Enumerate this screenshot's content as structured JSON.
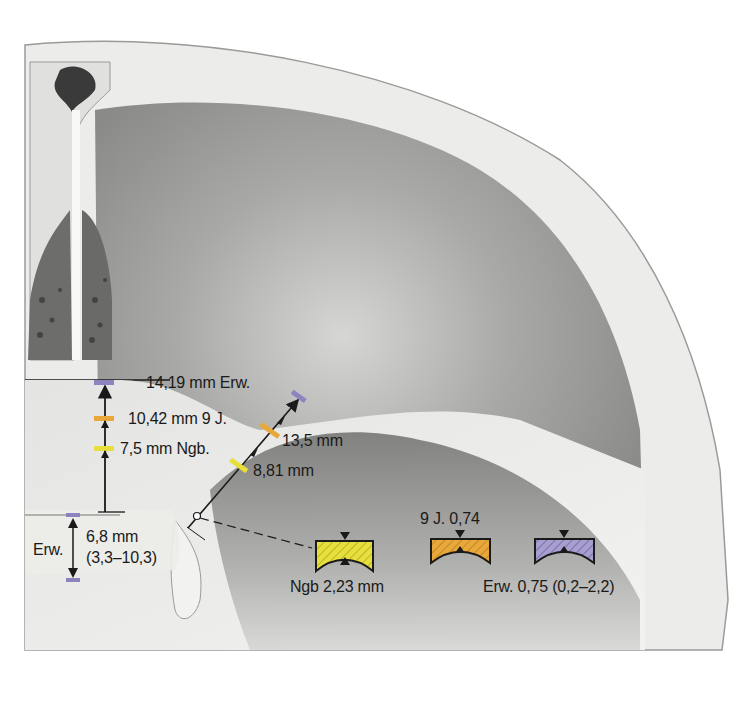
{
  "figure": {
    "colors": {
      "newborn": "#e6df3c",
      "nine_years": "#e8a93a",
      "adult": "#8e82bf",
      "bone_light": "#eeeeec",
      "bone_shade": "#8c8c8c",
      "line": "#1a1a1a"
    }
  },
  "vertical_measurement": {
    "labels": [
      {
        "id": "adult",
        "text": "14,19 mm Erw."
      },
      {
        "id": "nine_years",
        "text": "10,42 mm 9 J."
      },
      {
        "id": "newborn",
        "text": "7,5 mm Ngb."
      }
    ]
  },
  "oblique_measurement": {
    "labels": [
      {
        "id": "adult_9y",
        "text": "13,5 mm"
      },
      {
        "id": "newborn",
        "text": "8,81 mm"
      }
    ]
  },
  "lower_measurement": {
    "side_label": "Erw.",
    "value": "6,8 mm",
    "range": "(3,3–10,3)"
  },
  "thickness_legend": [
    {
      "id": "newborn",
      "label": "Ngb 2,23 mm",
      "color": "#e6df3c"
    },
    {
      "id": "nine_years",
      "label": "9 J. 0,74",
      "color": "#e8a93a"
    },
    {
      "id": "adult",
      "label": "Erw. 0,75 (0,2–2,2)",
      "color": "#8e82bf"
    }
  ]
}
